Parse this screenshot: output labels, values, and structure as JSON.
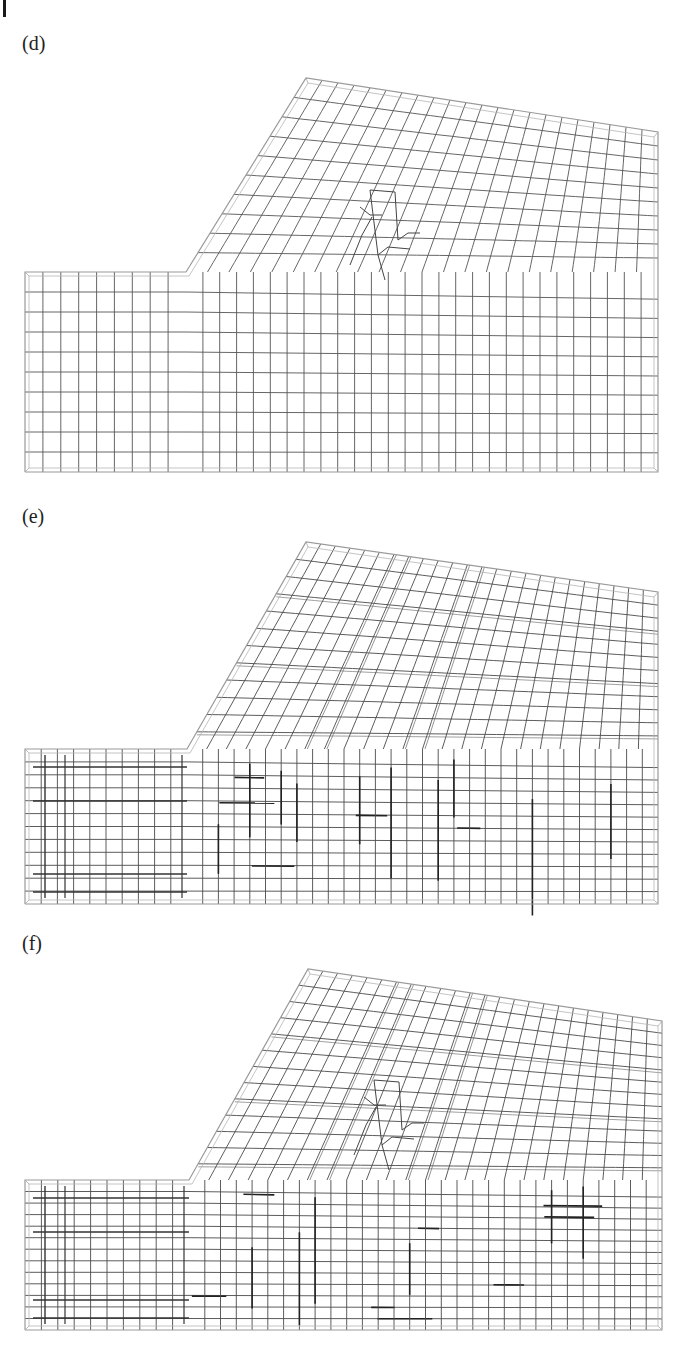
{
  "page": {
    "type": "figure-page",
    "header_fragment": ""
  },
  "figure": {
    "panels": [
      {
        "label": "(d)",
        "label_pos": [
          22,
          32
        ],
        "outline": {
          "step_left_x": 25,
          "step_top_y": 272,
          "step_x": 186,
          "apex": [
            306,
            78
          ],
          "top_right": [
            658,
            132
          ],
          "bottom_y": 472
        },
        "mesh": {
          "style": "uniform",
          "upper_cols": 22,
          "upper_rows": 10,
          "lower_cols_left": 9,
          "lower_cols_right": 28,
          "lower_rows": 10,
          "refinement_patch": true,
          "line_color": "#555555"
        }
      },
      {
        "label": "(e)",
        "label_pos": [
          22,
          505
        ],
        "outline": {
          "step_left_x": 25,
          "step_top_y": 749,
          "step_x": 187,
          "apex": [
            306,
            542
          ],
          "top_right": [
            658,
            592
          ],
          "bottom_y": 904
        },
        "mesh": {
          "style": "nonuniform",
          "upper_cols": 24,
          "upper_rows": 12,
          "lower_cols_left": 10,
          "lower_cols_right": 30,
          "lower_rows": 12,
          "refinement_patch": false,
          "line_color": "#4a4a4a"
        }
      },
      {
        "label": "(f)",
        "label_pos": [
          22,
          932
        ],
        "outline": {
          "step_left_x": 25,
          "step_top_y": 1180,
          "step_x": 189,
          "apex": [
            308,
            969
          ],
          "top_right": [
            662,
            1021
          ],
          "bottom_y": 1330
        },
        "mesh": {
          "style": "nonuniform",
          "upper_cols": 24,
          "upper_rows": 13,
          "lower_cols_left": 10,
          "lower_cols_right": 30,
          "lower_rows": 13,
          "refinement_patch": true,
          "line_color": "#4a4a4a"
        }
      }
    ]
  }
}
